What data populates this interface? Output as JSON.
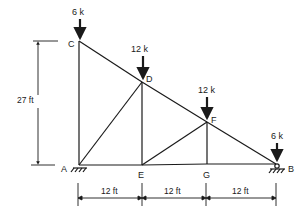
{
  "diagram": {
    "type": "truss",
    "nodes": {
      "A": {
        "label": "A"
      },
      "B": {
        "label": "B"
      },
      "C": {
        "label": "C"
      },
      "D": {
        "label": "D"
      },
      "E": {
        "label": "E"
      },
      "F": {
        "label": "F"
      },
      "G": {
        "label": "G"
      }
    },
    "loads": [
      {
        "node": "C",
        "label": "6 k"
      },
      {
        "node": "D",
        "label": "12 k"
      },
      {
        "node": "F",
        "label": "12 k"
      },
      {
        "node": "B",
        "label": "6 k"
      }
    ],
    "dimensions": {
      "height": "27 ft",
      "spans": [
        "12 ft",
        "12 ft",
        "12 ft"
      ]
    },
    "members": [
      "AC",
      "CD",
      "DF",
      "FB",
      "AE",
      "EG",
      "GB",
      "AD",
      "DE",
      "EF",
      "FG"
    ],
    "supports": {
      "A": "pin",
      "B": "roller"
    },
    "colors": {
      "line": "#1a1a1a",
      "background": "#ffffff"
    }
  }
}
